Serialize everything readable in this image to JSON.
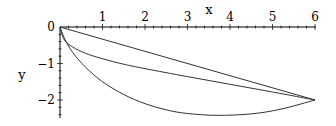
{
  "chart_data": {
    "type": "line",
    "title": "",
    "xlabel": "x",
    "ylabel": "y",
    "xlim": [
      0,
      6
    ],
    "ylim": [
      -2.5,
      0
    ],
    "x_ticks": [
      "1",
      "2",
      "3",
      "4",
      "5",
      "6"
    ],
    "y_ticks": [
      "0",
      "-1",
      "-2"
    ],
    "grid": false,
    "legend": null,
    "series": [
      {
        "name": "straight line",
        "x": [
          0,
          6
        ],
        "y": [
          0,
          -2
        ]
      },
      {
        "name": "middle curve",
        "x": [
          0,
          0.1,
          0.3,
          0.6,
          1,
          1.5,
          2,
          3,
          4,
          5,
          6
        ],
        "y": [
          0,
          -0.35,
          -0.55,
          -0.72,
          -0.87,
          -1.02,
          -1.14,
          -1.36,
          -1.57,
          -1.78,
          -2.0
        ]
      },
      {
        "name": "lower curve",
        "x": [
          0,
          0.1,
          0.3,
          0.6,
          1,
          1.5,
          2,
          2.5,
          3,
          3.7,
          4.5,
          5.2,
          6
        ],
        "y": [
          0,
          -0.3,
          -0.7,
          -1.1,
          -1.5,
          -1.85,
          -2.1,
          -2.27,
          -2.37,
          -2.42,
          -2.38,
          -2.25,
          -2.0
        ]
      }
    ]
  }
}
